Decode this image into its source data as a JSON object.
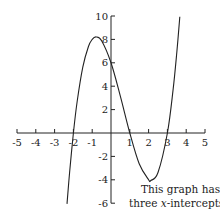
{
  "chart_data": {
    "type": "line",
    "title": "",
    "xlabel": "",
    "ylabel": "",
    "xlim": [
      -5,
      5
    ],
    "ylim": [
      -6,
      10
    ],
    "grid": false,
    "x_ticks": [
      -5,
      -4,
      -3,
      -2,
      -1,
      1,
      2,
      3,
      4,
      5
    ],
    "y_ticks": [
      10,
      8,
      6,
      4,
      2,
      -2,
      -4,
      -6
    ],
    "series": [
      {
        "name": "cubic",
        "x": [
          -2.34,
          -2.2,
          -2.0,
          -1.8,
          -1.5,
          -1.2,
          -1.0,
          -0.79,
          -0.5,
          0,
          0.5,
          1.0,
          1.5,
          2.0,
          2.12,
          2.5,
          3.0,
          3.3,
          3.5,
          3.66
        ],
        "y": [
          -6.06,
          -3.33,
          0,
          2.69,
          5.63,
          7.39,
          8,
          8.21,
          7.88,
          6,
          3.13,
          0,
          -2.63,
          -4,
          -4.06,
          -3.38,
          0,
          3.66,
          6.88,
          9.94
        ]
      }
    ],
    "x_intercepts": [
      -2,
      1,
      3
    ],
    "annotations": [
      {
        "text_line1": "This graph has",
        "text_line2_prefix": "three ",
        "text_line2_var": "x",
        "text_line2_suffix": "-intercepts."
      }
    ]
  },
  "caption": {
    "line1": "This graph has",
    "line2_prefix": "three ",
    "line2_var": "x",
    "line2_suffix": "-intercepts."
  }
}
